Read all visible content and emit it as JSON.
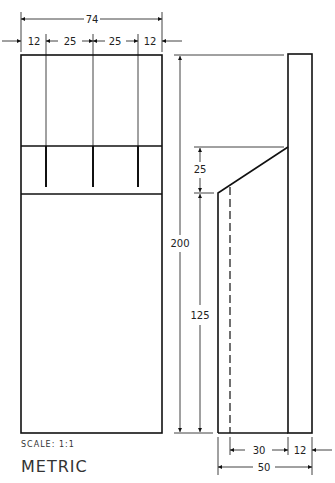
{
  "drawing": {
    "scale_label": "SCALE: 1:1",
    "units_label": "METRIC",
    "front_view": {
      "overall_width": "74",
      "segments": [
        "12",
        "25",
        "25",
        "12"
      ]
    },
    "side_view": {
      "overall_height": "200",
      "slope_height": "25",
      "lower_height": "125",
      "inner_width": "30",
      "back_thickness": "12",
      "overall_depth": "50"
    }
  }
}
